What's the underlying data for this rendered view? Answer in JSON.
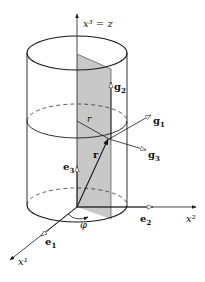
{
  "figure": {
    "kind": "cylindrical coordinate system",
    "labels": {
      "x3_axis": "x³ = z",
      "x2_axis": "x²",
      "x1_axis": "x¹",
      "g1": "g",
      "g1_sub": "1",
      "g2": "g",
      "g2_sub": "2",
      "g3": "g",
      "g3_sub": "3",
      "e1": "e",
      "e1_sub": "1",
      "e2": "e",
      "e2_sub": "2",
      "e3": "e",
      "e3_sub": "3",
      "r_vector": "r",
      "r_radius": "r",
      "phi": "φ"
    },
    "colors": {
      "line": "#1a1a1a",
      "plane_fill": "#c8c8c8",
      "background": "#ffffff"
    }
  }
}
